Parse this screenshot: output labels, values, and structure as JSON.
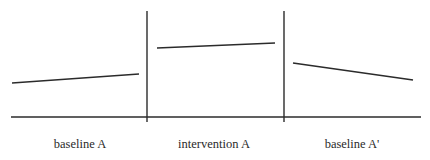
{
  "diagram": {
    "type": "single-case ABA design",
    "colors": {
      "stroke": "#2b2b2b",
      "text": "#2a2a2a",
      "background": "#ffffff"
    },
    "axis": {
      "x1": 11,
      "x2": 421,
      "y": 117
    },
    "dividers": [
      {
        "x": 147,
        "y1": 11,
        "y2": 122
      },
      {
        "x": 284,
        "y1": 11,
        "y2": 122
      }
    ],
    "phases": [
      {
        "label": "baseline A",
        "label_x": 80,
        "trend": {
          "x1": 12,
          "y1": 83,
          "x2": 139,
          "y2": 74
        }
      },
      {
        "label": "intervention A",
        "label_x": 214,
        "trend": {
          "x1": 157,
          "y1": 48,
          "x2": 275,
          "y2": 43
        }
      },
      {
        "label": "baseline A'",
        "label_x": 352,
        "trend": {
          "x1": 293,
          "y1": 63,
          "x2": 413,
          "y2": 80
        }
      }
    ],
    "label_y": 148
  }
}
